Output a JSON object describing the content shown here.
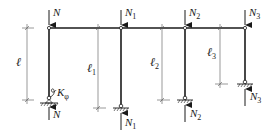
{
  "diagram": {
    "type": "structural-frame",
    "colors": {
      "line": "#1a1a1a",
      "dim": "#555555",
      "background": "#ffffff"
    },
    "beam": {
      "y": 28,
      "x_start": 49,
      "x_end": 245
    },
    "columns": [
      {
        "id": "col-0",
        "x": 49,
        "base_y": 100,
        "support": "hinge-with-rotational-spring",
        "top_load": {
          "symbol": "N",
          "sub": ""
        },
        "bottom_reaction": {
          "symbol": "N",
          "sub": ""
        },
        "length_label": {
          "symbol": "ℓ",
          "sub": ""
        },
        "dim_x": 27,
        "spring_label": {
          "symbol": "K",
          "sub": "φ"
        }
      },
      {
        "id": "col-1",
        "x": 121,
        "base_y": 108,
        "support": "hinge",
        "top_load": {
          "symbol": "N",
          "sub": "1"
        },
        "bottom_reaction": {
          "symbol": "N",
          "sub": "1"
        },
        "length_label": {
          "symbol": "ℓ",
          "sub": "1"
        },
        "dim_x": 98
      },
      {
        "id": "col-2",
        "x": 185,
        "base_y": 100,
        "support": "hinge",
        "top_load": {
          "symbol": "N",
          "sub": "2"
        },
        "bottom_reaction": {
          "symbol": "N",
          "sub": "2"
        },
        "length_label": {
          "symbol": "ℓ",
          "sub": "2"
        },
        "dim_x": 162
      },
      {
        "id": "col-3",
        "x": 245,
        "base_y": 84,
        "support": "hinge",
        "top_load": {
          "symbol": "N",
          "sub": "3"
        },
        "bottom_reaction": {
          "symbol": "N",
          "sub": "3"
        },
        "length_label": {
          "symbol": "ℓ",
          "sub": "3"
        },
        "dim_x": 220
      }
    ]
  }
}
